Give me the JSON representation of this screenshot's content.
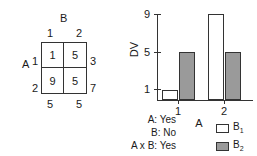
{
  "table": {
    "column_factor_label": "B",
    "row_factor_label": "A",
    "column_headers": [
      "1",
      "2"
    ],
    "row_headers": [
      "1",
      "2"
    ],
    "cells": [
      [
        "1",
        "5"
      ],
      [
        "9",
        "5"
      ]
    ],
    "row_margins": [
      "3",
      "7"
    ],
    "column_margins": [
      "5",
      "5"
    ]
  },
  "annotations": {
    "lines": [
      "A: Yes",
      "B: No",
      "A x B: Yes"
    ]
  },
  "legend": {
    "items": [
      {
        "label": "B",
        "sub": "1",
        "swatch": "white-swatch-icon",
        "color": "#ffffff"
      },
      {
        "label": "B",
        "sub": "2",
        "swatch": "gray-swatch-icon",
        "color": "#9a9a9a"
      }
    ]
  },
  "chart_data": {
    "type": "bar",
    "title": "",
    "xlabel": "A",
    "ylabel": "DV",
    "categories": [
      "1",
      "2"
    ],
    "series": [
      {
        "name": "B1",
        "values": [
          1,
          9
        ],
        "color": "#ffffff"
      },
      {
        "name": "B2",
        "values": [
          5,
          5
        ],
        "color": "#9a9a9a"
      }
    ],
    "yticks": [
      1,
      5,
      9
    ],
    "ylim": [
      0,
      9
    ],
    "xticks": [
      "1",
      "2"
    ],
    "grid": false,
    "legend_position": "bottom-right"
  }
}
